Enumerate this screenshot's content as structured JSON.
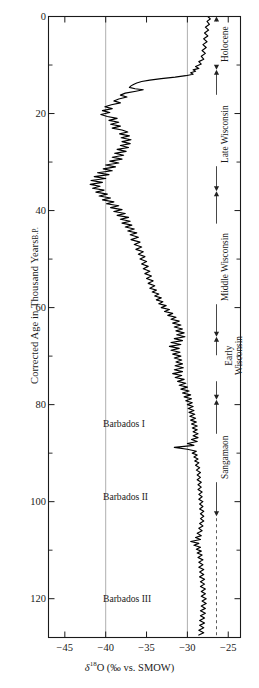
{
  "figure": {
    "background": "#ffffff",
    "line_color": "#000000",
    "grid_color": "#9a9a9a",
    "axis_color": "#1a1a1a"
  },
  "axes": {
    "y_title_main": "Corrected Age in Thousand Years",
    "y_title_suffix": "B.P.",
    "y_ticks": [
      "0",
      "20",
      "40",
      "60",
      "80",
      "100",
      "120"
    ],
    "y_tick_values": [
      0,
      20,
      40,
      60,
      80,
      100,
      120
    ],
    "y_minor_values": [
      10,
      30,
      50,
      70,
      90,
      110
    ],
    "y_range": [
      0,
      128
    ],
    "x_ticks": [
      "−45",
      "−40",
      "−35",
      "−30",
      "−25"
    ],
    "x_tick_values": [
      -45,
      -40,
      -35,
      -30,
      -25
    ],
    "x_range": [
      -47,
      -23.5
    ],
    "x_gridlines": [
      -40,
      -30
    ],
    "x_title_symbol": "δ",
    "x_title_sup": "18",
    "x_title_rest": "O (‰ vs. SMOW)"
  },
  "annotations": {
    "in_plot": [
      {
        "label": "Barbados I",
        "age_ka": 84
      },
      {
        "label": "Barbados II",
        "age_ka": 99
      },
      {
        "label": "Barbados III",
        "age_ka": 120
      }
    ],
    "stages": [
      {
        "label": "Holocene",
        "top_ka": 0,
        "bottom_ka": 11,
        "style": "solid",
        "lines": [
          "Holocene"
        ]
      },
      {
        "label": "Late Wisconsin",
        "top_ka": 11,
        "bottom_ka": 36,
        "style": "solid",
        "lines": [
          "Late Wisconsin"
        ]
      },
      {
        "label": "Middle Wisconsin",
        "top_ka": 36,
        "bottom_ka": 66,
        "style": "solid",
        "lines": [
          "Middle Wisconsin"
        ]
      },
      {
        "label": "Early Wisconsin",
        "top_ka": 66,
        "bottom_ka": 79,
        "style": "solid",
        "lines": [
          "Early",
          "Wisconsin"
        ]
      },
      {
        "label": "Sangamaon",
        "top_ka": 79,
        "bottom_ka": 103,
        "style": "solid",
        "lines": [
          "Sangamaon"
        ]
      },
      {
        "label": "",
        "top_ka": 103,
        "bottom_ka": 128,
        "style": "dashed",
        "lines": []
      }
    ]
  },
  "chart_data": {
    "type": "line",
    "title": "",
    "xlabel": "δ18O (‰ vs. SMOW)",
    "ylabel": "Corrected Age in Thousand Years B.P.",
    "xlim": [
      -47,
      -23.5
    ],
    "ylim": [
      128,
      0
    ],
    "y_inverted": true,
    "grid": "vertical gridlines at -40 and -30",
    "legend": "none",
    "series_name": "δ18O ice core record",
    "orientation": "x = δ18O value, y = age (ka B.P., increasing downward)",
    "points": [
      [
        -27.5,
        0.0
      ],
      [
        -27.2,
        0.5
      ],
      [
        -27.6,
        1.0
      ],
      [
        -27.3,
        1.6
      ],
      [
        -27.8,
        2.2
      ],
      [
        -27.4,
        2.8
      ],
      [
        -27.9,
        3.4
      ],
      [
        -27.5,
        4.0
      ],
      [
        -28.0,
        4.6
      ],
      [
        -27.6,
        5.2
      ],
      [
        -28.1,
        5.8
      ],
      [
        -27.7,
        6.4
      ],
      [
        -28.2,
        7.0
      ],
      [
        -27.8,
        7.6
      ],
      [
        -28.3,
        8.2
      ],
      [
        -28.0,
        8.8
      ],
      [
        -28.6,
        9.3
      ],
      [
        -28.3,
        9.8
      ],
      [
        -29.0,
        10.3
      ],
      [
        -28.6,
        10.7
      ],
      [
        -29.3,
        11.0
      ],
      [
        -29.0,
        11.3
      ],
      [
        -29.6,
        11.6
      ],
      [
        -29.3,
        11.9
      ],
      [
        -30.2,
        12.2
      ],
      [
        -31.5,
        12.5
      ],
      [
        -33.2,
        12.8
      ],
      [
        -34.6,
        13.1
      ],
      [
        -35.6,
        13.4
      ],
      [
        -36.2,
        13.7
      ],
      [
        -36.6,
        14.0
      ],
      [
        -36.9,
        14.3
      ],
      [
        -37.1,
        14.6
      ],
      [
        -36.4,
        14.9
      ],
      [
        -35.4,
        15.1
      ],
      [
        -36.3,
        15.4
      ],
      [
        -37.6,
        15.8
      ],
      [
        -38.2,
        16.2
      ],
      [
        -37.4,
        16.6
      ],
      [
        -38.4,
        17.0
      ],
      [
        -39.0,
        17.4
      ],
      [
        -38.2,
        17.8
      ],
      [
        -39.3,
        18.2
      ],
      [
        -40.1,
        18.6
      ],
      [
        -39.2,
        19.0
      ],
      [
        -40.4,
        19.4
      ],
      [
        -39.5,
        19.8
      ],
      [
        -40.6,
        20.2
      ],
      [
        -39.8,
        20.6
      ],
      [
        -38.6,
        21.0
      ],
      [
        -39.6,
        21.4
      ],
      [
        -38.4,
        21.8
      ],
      [
        -39.4,
        22.2
      ],
      [
        -38.2,
        22.6
      ],
      [
        -39.2,
        23.0
      ],
      [
        -38.0,
        23.4
      ],
      [
        -37.3,
        23.8
      ],
      [
        -38.3,
        24.2
      ],
      [
        -37.1,
        24.6
      ],
      [
        -38.1,
        25.0
      ],
      [
        -36.9,
        25.4
      ],
      [
        -38.0,
        25.8
      ],
      [
        -37.0,
        26.2
      ],
      [
        -38.2,
        26.6
      ],
      [
        -37.2,
        27.0
      ],
      [
        -38.6,
        27.4
      ],
      [
        -37.5,
        27.8
      ],
      [
        -38.9,
        28.2
      ],
      [
        -37.8,
        28.6
      ],
      [
        -39.2,
        29.0
      ],
      [
        -38.0,
        29.4
      ],
      [
        -39.5,
        29.8
      ],
      [
        -38.4,
        30.2
      ],
      [
        -40.0,
        30.6
      ],
      [
        -38.8,
        31.0
      ],
      [
        -40.3,
        31.4
      ],
      [
        -39.2,
        31.8
      ],
      [
        -41.0,
        32.2
      ],
      [
        -39.6,
        32.6
      ],
      [
        -41.4,
        33.0
      ],
      [
        -40.0,
        33.4
      ],
      [
        -41.8,
        33.8
      ],
      [
        -40.4,
        34.2
      ],
      [
        -41.9,
        34.6
      ],
      [
        -40.7,
        35.0
      ],
      [
        -41.6,
        35.4
      ],
      [
        -40.2,
        35.8
      ],
      [
        -41.2,
        36.2
      ],
      [
        -39.8,
        36.6
      ],
      [
        -40.8,
        37.0
      ],
      [
        -39.4,
        37.4
      ],
      [
        -40.4,
        37.8
      ],
      [
        -39.0,
        38.2
      ],
      [
        -39.9,
        38.6
      ],
      [
        -38.4,
        39.0
      ],
      [
        -39.4,
        39.4
      ],
      [
        -38.0,
        39.8
      ],
      [
        -39.0,
        40.2
      ],
      [
        -37.6,
        40.6
      ],
      [
        -38.6,
        41.0
      ],
      [
        -37.2,
        41.4
      ],
      [
        -38.2,
        41.8
      ],
      [
        -37.0,
        42.2
      ],
      [
        -38.0,
        42.6
      ],
      [
        -36.8,
        43.0
      ],
      [
        -37.6,
        43.4
      ],
      [
        -36.5,
        43.8
      ],
      [
        -37.3,
        44.2
      ],
      [
        -36.2,
        44.6
      ],
      [
        -37.0,
        45.0
      ],
      [
        -36.0,
        45.5
      ],
      [
        -36.9,
        46.0
      ],
      [
        -35.8,
        46.5
      ],
      [
        -36.5,
        47.0
      ],
      [
        -35.6,
        47.5
      ],
      [
        -36.3,
        48.0
      ],
      [
        -35.4,
        48.5
      ],
      [
        -36.0,
        49.0
      ],
      [
        -35.2,
        49.5
      ],
      [
        -35.8,
        50.0
      ],
      [
        -35.0,
        50.5
      ],
      [
        -35.6,
        51.0
      ],
      [
        -34.8,
        51.5
      ],
      [
        -35.4,
        52.0
      ],
      [
        -34.6,
        52.5
      ],
      [
        -35.2,
        53.0
      ],
      [
        -34.4,
        53.5
      ],
      [
        -35.0,
        54.0
      ],
      [
        -34.2,
        54.5
      ],
      [
        -34.8,
        55.0
      ],
      [
        -34.0,
        55.5
      ],
      [
        -34.6,
        56.0
      ],
      [
        -33.8,
        56.4
      ],
      [
        -34.3,
        56.8
      ],
      [
        -33.5,
        57.2
      ],
      [
        -34.0,
        57.6
      ],
      [
        -33.2,
        58.0
      ],
      [
        -33.8,
        58.4
      ],
      [
        -33.0,
        58.8
      ],
      [
        -33.5,
        59.2
      ],
      [
        -32.6,
        59.6
      ],
      [
        -33.2,
        60.0
      ],
      [
        -32.2,
        60.4
      ],
      [
        -32.8,
        60.8
      ],
      [
        -31.8,
        61.2
      ],
      [
        -32.4,
        61.6
      ],
      [
        -31.4,
        62.0
      ],
      [
        -32.0,
        62.4
      ],
      [
        -31.0,
        62.8
      ],
      [
        -31.8,
        63.2
      ],
      [
        -30.8,
        63.6
      ],
      [
        -31.6,
        64.0
      ],
      [
        -30.6,
        64.4
      ],
      [
        -31.4,
        64.8
      ],
      [
        -30.4,
        65.2
      ],
      [
        -31.3,
        65.6
      ],
      [
        -30.3,
        66.0
      ],
      [
        -31.6,
        66.4
      ],
      [
        -30.6,
        66.8
      ],
      [
        -32.0,
        67.2
      ],
      [
        -30.8,
        67.6
      ],
      [
        -32.2,
        68.0
      ],
      [
        -31.0,
        68.4
      ],
      [
        -32.0,
        68.8
      ],
      [
        -30.9,
        69.2
      ],
      [
        -31.8,
        69.6
      ],
      [
        -30.8,
        70.0
      ],
      [
        -31.6,
        70.4
      ],
      [
        -30.7,
        70.8
      ],
      [
        -31.4,
        71.2
      ],
      [
        -30.6,
        71.6
      ],
      [
        -31.5,
        72.0
      ],
      [
        -30.5,
        72.4
      ],
      [
        -31.6,
        72.8
      ],
      [
        -30.6,
        73.2
      ],
      [
        -31.8,
        73.6
      ],
      [
        -30.7,
        74.0
      ],
      [
        -31.5,
        74.4
      ],
      [
        -30.4,
        74.8
      ],
      [
        -31.2,
        75.2
      ],
      [
        -30.2,
        75.6
      ],
      [
        -31.0,
        76.0
      ],
      [
        -30.0,
        76.4
      ],
      [
        -30.8,
        76.8
      ],
      [
        -29.8,
        77.2
      ],
      [
        -30.6,
        77.6
      ],
      [
        -29.6,
        78.0
      ],
      [
        -30.4,
        78.4
      ],
      [
        -29.5,
        78.8
      ],
      [
        -30.2,
        79.2
      ],
      [
        -29.4,
        79.6
      ],
      [
        -30.0,
        80.0
      ],
      [
        -29.3,
        80.4
      ],
      [
        -29.9,
        80.8
      ],
      [
        -29.2,
        81.2
      ],
      [
        -29.8,
        81.6
      ],
      [
        -29.1,
        82.0
      ],
      [
        -29.7,
        82.4
      ],
      [
        -29.0,
        82.8
      ],
      [
        -29.6,
        83.2
      ],
      [
        -28.9,
        83.6
      ],
      [
        -29.5,
        84.0
      ],
      [
        -28.8,
        84.4
      ],
      [
        -29.4,
        84.8
      ],
      [
        -28.8,
        85.2
      ],
      [
        -29.3,
        85.6
      ],
      [
        -28.7,
        86.0
      ],
      [
        -29.3,
        86.4
      ],
      [
        -28.7,
        86.8
      ],
      [
        -29.5,
        87.2
      ],
      [
        -28.8,
        87.6
      ],
      [
        -30.0,
        88.0
      ],
      [
        -29.2,
        88.4
      ],
      [
        -31.6,
        88.8
      ],
      [
        -30.0,
        89.2
      ],
      [
        -28.9,
        89.6
      ],
      [
        -29.4,
        90.0
      ],
      [
        -28.8,
        90.4
      ],
      [
        -29.2,
        90.8
      ],
      [
        -28.7,
        91.2
      ],
      [
        -29.1,
        91.6
      ],
      [
        -28.6,
        92.0
      ],
      [
        -29.0,
        92.5
      ],
      [
        -28.5,
        93.0
      ],
      [
        -28.9,
        93.5
      ],
      [
        -28.4,
        94.0
      ],
      [
        -28.8,
        94.5
      ],
      [
        -28.4,
        95.0
      ],
      [
        -28.8,
        95.5
      ],
      [
        -28.3,
        96.0
      ],
      [
        -28.7,
        96.5
      ],
      [
        -28.3,
        97.0
      ],
      [
        -28.7,
        97.5
      ],
      [
        -28.2,
        98.0
      ],
      [
        -28.6,
        98.5
      ],
      [
        -28.2,
        99.0
      ],
      [
        -28.6,
        99.5
      ],
      [
        -28.1,
        100.0
      ],
      [
        -28.5,
        100.5
      ],
      [
        -28.1,
        101.0
      ],
      [
        -28.5,
        101.5
      ],
      [
        -28.0,
        102.0
      ],
      [
        -28.4,
        102.5
      ],
      [
        -28.0,
        103.0
      ],
      [
        -28.4,
        103.5
      ],
      [
        -28.0,
        104.0
      ],
      [
        -28.5,
        104.5
      ],
      [
        -28.1,
        105.0
      ],
      [
        -28.6,
        105.5
      ],
      [
        -28.2,
        106.0
      ],
      [
        -28.8,
        106.5
      ],
      [
        -28.3,
        107.0
      ],
      [
        -29.0,
        107.4
      ],
      [
        -28.4,
        107.8
      ],
      [
        -29.6,
        108.2
      ],
      [
        -28.6,
        108.6
      ],
      [
        -29.2,
        109.0
      ],
      [
        -28.4,
        109.4
      ],
      [
        -28.9,
        109.8
      ],
      [
        -28.3,
        110.2
      ],
      [
        -28.8,
        110.6
      ],
      [
        -28.2,
        111.0
      ],
      [
        -28.7,
        111.5
      ],
      [
        -28.1,
        112.0
      ],
      [
        -28.6,
        112.5
      ],
      [
        -28.1,
        113.0
      ],
      [
        -28.6,
        113.5
      ],
      [
        -28.0,
        114.0
      ],
      [
        -28.5,
        114.5
      ],
      [
        -28.0,
        115.0
      ],
      [
        -28.5,
        115.5
      ],
      [
        -27.9,
        116.0
      ],
      [
        -28.4,
        116.5
      ],
      [
        -27.9,
        117.0
      ],
      [
        -28.4,
        117.5
      ],
      [
        -27.8,
        118.0
      ],
      [
        -28.3,
        118.5
      ],
      [
        -27.8,
        119.0
      ],
      [
        -28.3,
        119.5
      ],
      [
        -27.7,
        120.0
      ],
      [
        -28.2,
        120.5
      ],
      [
        -27.7,
        121.0
      ],
      [
        -28.3,
        121.5
      ],
      [
        -27.8,
        122.0
      ],
      [
        -28.4,
        122.5
      ],
      [
        -27.8,
        123.0
      ],
      [
        -28.4,
        123.5
      ],
      [
        -27.9,
        124.0
      ],
      [
        -28.5,
        124.5
      ],
      [
        -27.9,
        125.0
      ],
      [
        -28.5,
        125.5
      ],
      [
        -28.0,
        126.0
      ],
      [
        -28.6,
        126.5
      ],
      [
        -28.0,
        127.0
      ],
      [
        -28.6,
        127.5
      ]
    ]
  }
}
